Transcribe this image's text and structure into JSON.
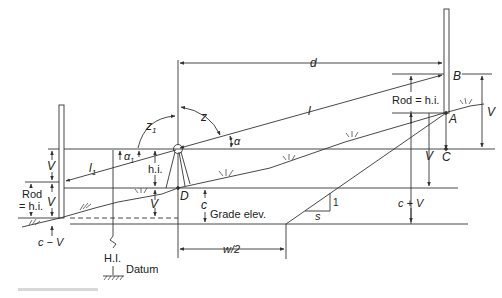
{
  "diagram": {
    "labels": {
      "d": "d",
      "B": "B",
      "A": "A",
      "C": "C",
      "D": "D",
      "l": "l",
      "l1": "l",
      "l1_sub": "1",
      "z": "z",
      "z1": "z",
      "z1_sub": "1",
      "alpha": "α",
      "alpha1": "α",
      "alpha1_sub": "1",
      "V_right_outer": "V",
      "V_right_inner": "V",
      "V_left_upper": "V",
      "V_left_lower": "V",
      "V_center": "V",
      "rod_hi_right": "Rod = h.i.",
      "rod_hi_left_line1": "Rod",
      "rod_hi_left_line2": "= h.i.",
      "hi_center": "h.i.",
      "c": "c",
      "c_plus_V": "c + V",
      "c_minus_V": "c − V",
      "grade_elev": "Grade elev.",
      "w_half": "w/2",
      "slope_s": "s",
      "slope_1": "1",
      "HI": "H.I.",
      "datum": "Datum"
    },
    "colors": {
      "line": "#333333",
      "text": "#222222",
      "background": "#ffffff"
    }
  }
}
